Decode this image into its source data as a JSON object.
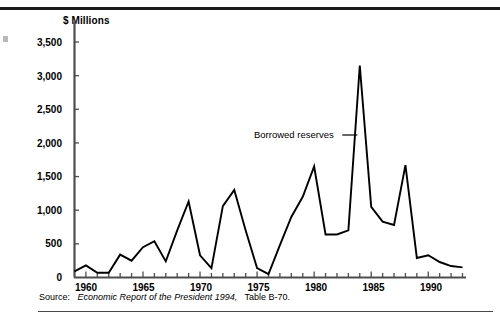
{
  "figure": {
    "axis_title": "$ Millions",
    "annotation": "Borrowed reserves",
    "source_label": "Source:",
    "source_body": "Economic Report of the President 1994,",
    "source_tail": "Table B-70.",
    "line_color": "#000000",
    "axis_color": "#4d4d4d",
    "background": "#ffffff"
  },
  "chart_data": {
    "type": "line",
    "title": "",
    "subtitle": "",
    "xlabel": "",
    "ylabel": "$ Millions",
    "ylim": [
      0,
      3500
    ],
    "xlim": [
      1959,
      1993
    ],
    "grid": false,
    "legend": "none",
    "annotations": [
      {
        "text": "Borrowed reserves",
        "points_to_x": 1984,
        "points_to_y": 2100
      }
    ],
    "ytick_labels": [
      "0",
      "500",
      "1,000",
      "1,500",
      "2,000",
      "2,500",
      "3,000",
      "3,500"
    ],
    "ytick_values": [
      0,
      500,
      1000,
      1500,
      2000,
      2500,
      3000,
      3500
    ],
    "xtick_labels": [
      "1960",
      "1965",
      "1970",
      "1975",
      "1980",
      "1985",
      "1990"
    ],
    "xtick_values": [
      1960,
      1965,
      1970,
      1975,
      1980,
      1985,
      1990
    ],
    "x": [
      1959,
      1960,
      1961,
      1962,
      1963,
      1964,
      1965,
      1966,
      1967,
      1968,
      1969,
      1970,
      1971,
      1972,
      1973,
      1974,
      1975,
      1976,
      1977,
      1978,
      1979,
      1980,
      1981,
      1982,
      1983,
      1984,
      1985,
      1986,
      1987,
      1988,
      1989,
      1990,
      1991,
      1992,
      1993
    ],
    "series": [
      {
        "name": "Borrowed reserves",
        "values": [
          90,
          180,
          70,
          70,
          340,
          250,
          450,
          540,
          240,
          700,
          1130,
          330,
          140,
          1060,
          1300,
          700,
          140,
          50,
          480,
          900,
          1200,
          1650,
          640,
          640,
          700,
          3150,
          1050,
          830,
          780,
          1670,
          290,
          330,
          230,
          170,
          150
        ]
      }
    ]
  }
}
